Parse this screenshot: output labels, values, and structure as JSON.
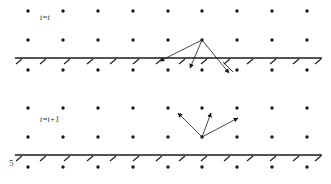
{
  "panels": [
    {
      "id": "top",
      "label": "t=t",
      "label_pos": [
        40,
        19
      ],
      "wall_y": 58,
      "row_ys": [
        11,
        40,
        70
      ],
      "hatch_y": 58,
      "arrows": {
        "origin": [
          202,
          40
        ],
        "targets": [
          [
            160,
            61
          ],
          [
            190,
            68
          ],
          [
            229,
            73
          ]
        ],
        "extra_cross": [
          [
            223,
            62
          ],
          [
            233,
            72
          ]
        ]
      }
    },
    {
      "id": "bottom",
      "label": "t=t+1",
      "label_pos": [
        40,
        121
      ],
      "wall_y": 155,
      "row_ys": [
        108,
        137,
        167
      ],
      "hatch_y": 155,
      "arrows": {
        "origin": [
          202,
          137
        ],
        "targets": [
          [
            178,
            113
          ],
          [
            211,
            113
          ],
          [
            238,
            118
          ]
        ]
      }
    }
  ],
  "column_xs": [
    28,
    63,
    98,
    133,
    168,
    202,
    237,
    272,
    307
  ],
  "hatch_xs": [
    20,
    44,
    68,
    91,
    114,
    137,
    160,
    183,
    205,
    228,
    251,
    274,
    297,
    319
  ],
  "page_number": "5",
  "colors": {
    "ink": "#1a1a1a",
    "background": "#ffffff"
  }
}
